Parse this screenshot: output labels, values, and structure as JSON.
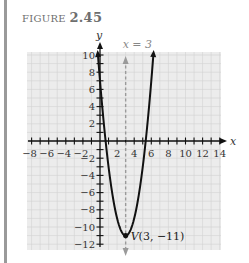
{
  "figure": {
    "label": "FIGURE",
    "number": "2.45"
  },
  "colors": {
    "grid_bg": "#ececec",
    "grid_line": "#d2d2d2",
    "axis": "#111111",
    "curve": "#111111",
    "symmetry_line": "#9a9a9a",
    "side_bar": "#9a9a9a"
  },
  "chart_data": {
    "type": "line",
    "title": "FIGURE 2.45",
    "xlabel": "x",
    "ylabel": "y",
    "xlim": [
      -8,
      15
    ],
    "ylim": [
      -12,
      11
    ],
    "grid": true,
    "x_tick_labels": [
      "-8",
      "-6",
      "-4",
      "-2",
      "2",
      "4",
      "6",
      "8",
      "10",
      "12",
      "14"
    ],
    "y_tick_labels": [
      "10",
      "8",
      "6",
      "4",
      "2",
      "-2",
      "-4",
      "-6",
      "-8",
      "-10",
      "-12"
    ],
    "series": [
      {
        "name": "parabola",
        "equation": "y = 2(x - 3)^2 - 11",
        "x": [
          0.4,
          1,
          2,
          3,
          4,
          5,
          5.6
        ],
        "y": [
          2.52,
          -3,
          -9,
          -11,
          -9,
          -3,
          2.52
        ],
        "arrows_at_ends": true,
        "extends_to_y": 10
      }
    ],
    "annotations": [
      {
        "text": "x = 3",
        "type": "axis_of_symmetry",
        "x": 3,
        "style": "dashed",
        "color": "#9a9a9a"
      },
      {
        "text": "V(3, −11)",
        "type": "vertex",
        "x": 3,
        "y": -11
      }
    ]
  }
}
